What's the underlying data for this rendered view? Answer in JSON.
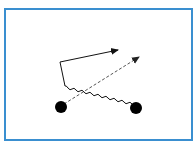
{
  "diagram": {
    "type": "particle-interaction",
    "colors": {
      "background": "#ffffff",
      "border": "#3a8fd0",
      "ink": "#111111",
      "dashed": "#555555"
    },
    "border": {
      "x": 5,
      "y": 9,
      "width": 187,
      "height": 131,
      "stroke_width": 2
    },
    "nodes": [
      {
        "id": "left-particle",
        "cx": 61,
        "cy": 107,
        "r": 6
      },
      {
        "id": "right-particle",
        "cx": 136,
        "cy": 108,
        "r": 6
      }
    ],
    "edges": [
      {
        "id": "dashed-arrow",
        "style": "dashed",
        "from": [
          64,
          104
        ],
        "to": [
          139,
          57
        ]
      },
      {
        "id": "wavy-line",
        "style": "wavy",
        "from": [
          132,
          104
        ],
        "to": [
          61,
          68
        ]
      },
      {
        "id": "solid-arrow",
        "style": "solid",
        "from": [
          60,
          62
        ],
        "to": [
          118,
          50
        ]
      }
    ]
  }
}
